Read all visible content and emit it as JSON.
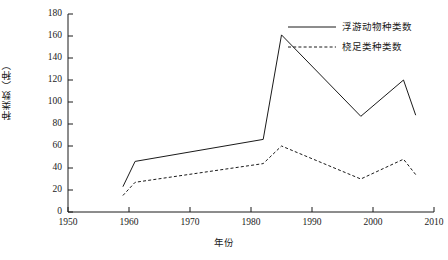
{
  "chart_data": {
    "type": "line",
    "title": "",
    "xlabel": "年份",
    "ylabel": "种类数（种）",
    "xlim": [
      1950,
      2010
    ],
    "ylim": [
      0,
      180
    ],
    "xticks": [
      1950,
      1960,
      1970,
      1980,
      1990,
      2000,
      2010
    ],
    "xtick_labels": [
      "1950",
      "1960",
      "1970",
      "1980",
      "1990",
      "2000",
      "2010"
    ],
    "yticks": [
      0,
      20,
      40,
      60,
      80,
      100,
      120,
      140,
      160,
      180
    ],
    "ytick_labels": [
      "0",
      "20",
      "40",
      "60",
      "80",
      "100",
      "120",
      "140",
      "160",
      "180"
    ],
    "grid": false,
    "legend_position": "top-right",
    "series": [
      {
        "name": "浮游动物种类数",
        "style": "solid",
        "color": "#1a1a1a",
        "x": [
          1959,
          1961,
          1982,
          1985,
          1998,
          2005,
          2007
        ],
        "values": [
          23,
          46,
          66,
          161,
          87,
          120,
          88
        ]
      },
      {
        "name": "桡足类种类数",
        "style": "dashed",
        "color": "#1a1a1a",
        "x": [
          1959,
          1961,
          1982,
          1985,
          1998,
          2005,
          2007
        ],
        "values": [
          15,
          27,
          44,
          60,
          30,
          48,
          34
        ]
      }
    ]
  },
  "legend": {
    "entries": [
      {
        "label": "浮游动物种类数",
        "style": "solid"
      },
      {
        "label": "桡足类种类数",
        "style": "dashed"
      }
    ]
  }
}
